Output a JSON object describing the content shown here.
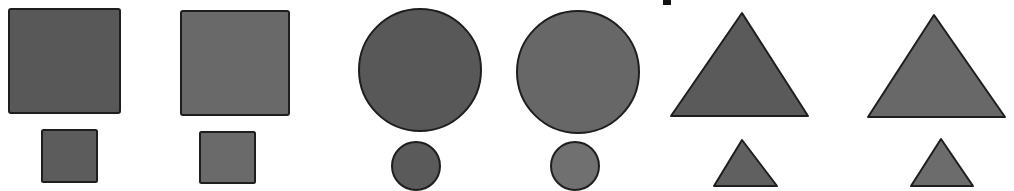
{
  "figure": {
    "background": "#ffffff",
    "stroke_color": "#1e1e1e",
    "colors": {
      "dark_fill": "#595959",
      "light_fill": "#6b6b6b"
    },
    "groups": [
      {
        "name": "squares",
        "pairs": [
          {
            "large": {
              "shape": "square",
              "x": 9,
              "y": 9,
              "w": 111,
              "h": 104,
              "fill": "#585858"
            },
            "small": {
              "shape": "square",
              "x": 42,
              "y": 130,
              "w": 55,
              "h": 52,
              "fill": "#5c5c5c"
            }
          },
          {
            "large": {
              "shape": "square",
              "x": 181,
              "y": 11,
              "w": 108,
              "h": 104,
              "fill": "#696969"
            },
            "small": {
              "shape": "square",
              "x": 200,
              "y": 132,
              "w": 55,
              "h": 51,
              "fill": "#6a6a6a"
            }
          }
        ]
      },
      {
        "name": "circles",
        "pairs": [
          {
            "large": {
              "shape": "circle",
              "cx": 420,
              "cy": 70,
              "r": 61,
              "fill": "#585858"
            },
            "small": {
              "shape": "circle",
              "cx": 416,
              "cy": 166,
              "r": 24,
              "fill": "#5a5a5a"
            }
          },
          {
            "large": {
              "shape": "circle",
              "cx": 578,
              "cy": 72,
              "r": 61,
              "fill": "#676767"
            },
            "small": {
              "shape": "circle",
              "cx": 575,
              "cy": 166,
              "r": 24,
              "fill": "#707070"
            }
          }
        ]
      },
      {
        "name": "triangles",
        "pairs": [
          {
            "large": {
              "shape": "triangle",
              "points": "742,13 808,116 671,116",
              "fill": "#5a5a5a"
            },
            "small": {
              "shape": "triangle",
              "points": "742,140 777,186 714,186",
              "fill": "#606060"
            }
          },
          {
            "large": {
              "shape": "triangle",
              "points": "934,15 1005,117 868,117",
              "fill": "#686868"
            },
            "small": {
              "shape": "triangle",
              "points": "941,139 973,186 911,186",
              "fill": "#6c6c6c"
            }
          }
        ]
      }
    ],
    "top_mark": {
      "x": 663,
      "y": 0,
      "w": 8,
      "h": 5,
      "fill": "#111111"
    }
  }
}
